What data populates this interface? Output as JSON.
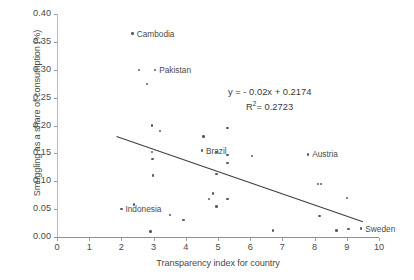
{
  "chart_data": {
    "type": "scatter",
    "title": "",
    "xlabel": "Transparency index for country",
    "ylabel": "Smuggling as a share of consumption (%)",
    "xlim": [
      0,
      10
    ],
    "ylim": [
      0,
      0.4
    ],
    "xticks": [
      "0",
      "1",
      "2",
      "3",
      "4",
      "5",
      "6",
      "7",
      "8",
      "9",
      "10"
    ],
    "yticks": [
      "0.00",
      "0.05",
      "0.10",
      "0.15",
      "0.20",
      "0.25",
      "0.30",
      "0.35",
      "0.40"
    ],
    "grid": false,
    "legend": "none",
    "trendline": {
      "equation": "y = - 0.02x + 0.2174",
      "r_squared_label": "R",
      "r_squared_exponent": "2",
      "r_squared_value": "= 0.2723",
      "slope": -0.02,
      "intercept": 0.2174,
      "x_start": 1.85,
      "x_end": 9.5
    },
    "points": [
      {
        "x": 2.35,
        "y": 0.365,
        "label": "Cambodia",
        "label_pos": "right"
      },
      {
        "x": 2.55,
        "y": 0.3,
        "label": "",
        "label_pos": ""
      },
      {
        "x": 3.05,
        "y": 0.3,
        "label": "Pakistan",
        "label_pos": "right"
      },
      {
        "x": 2.8,
        "y": 0.275,
        "label": "",
        "label_pos": ""
      },
      {
        "x": 2.95,
        "y": 0.2,
        "label": "",
        "label_pos": ""
      },
      {
        "x": 3.2,
        "y": 0.19,
        "label": "",
        "label_pos": ""
      },
      {
        "x": 5.3,
        "y": 0.195,
        "label": "",
        "label_pos": ""
      },
      {
        "x": 4.55,
        "y": 0.18,
        "label": "",
        "label_pos": ""
      },
      {
        "x": 2.95,
        "y": 0.152,
        "label": "",
        "label_pos": ""
      },
      {
        "x": 4.5,
        "y": 0.155,
        "label": "Brazil",
        "label_pos": "right"
      },
      {
        "x": 4.95,
        "y": 0.152,
        "label": "",
        "label_pos": ""
      },
      {
        "x": 5.3,
        "y": 0.147,
        "label": "",
        "label_pos": ""
      },
      {
        "x": 2.97,
        "y": 0.14,
        "label": "",
        "label_pos": ""
      },
      {
        "x": 6.05,
        "y": 0.145,
        "label": "",
        "label_pos": ""
      },
      {
        "x": 7.8,
        "y": 0.148,
        "label": "Austria",
        "label_pos": "right"
      },
      {
        "x": 5.3,
        "y": 0.133,
        "label": "",
        "label_pos": ""
      },
      {
        "x": 2.98,
        "y": 0.11,
        "label": "",
        "label_pos": ""
      },
      {
        "x": 4.95,
        "y": 0.113,
        "label": "",
        "label_pos": ""
      },
      {
        "x": 8.1,
        "y": 0.095,
        "label": "",
        "label_pos": ""
      },
      {
        "x": 8.2,
        "y": 0.095,
        "label": "",
        "label_pos": ""
      },
      {
        "x": 4.85,
        "y": 0.078,
        "label": "",
        "label_pos": ""
      },
      {
        "x": 4.72,
        "y": 0.068,
        "label": "",
        "label_pos": ""
      },
      {
        "x": 5.3,
        "y": 0.068,
        "label": "",
        "label_pos": ""
      },
      {
        "x": 9.0,
        "y": 0.07,
        "label": "",
        "label_pos": ""
      },
      {
        "x": 4.95,
        "y": 0.055,
        "label": "",
        "label_pos": ""
      },
      {
        "x": 2.4,
        "y": 0.058,
        "label": "",
        "label_pos": ""
      },
      {
        "x": 2.0,
        "y": 0.05,
        "label": "Indonesia",
        "label_pos": "right"
      },
      {
        "x": 8.15,
        "y": 0.038,
        "label": "",
        "label_pos": ""
      },
      {
        "x": 3.5,
        "y": 0.04,
        "label": "",
        "label_pos": ""
      },
      {
        "x": 3.93,
        "y": 0.03,
        "label": "",
        "label_pos": ""
      },
      {
        "x": 2.9,
        "y": 0.01,
        "label": "",
        "label_pos": ""
      },
      {
        "x": 6.7,
        "y": 0.012,
        "label": "",
        "label_pos": ""
      },
      {
        "x": 8.68,
        "y": 0.012,
        "label": "",
        "label_pos": ""
      },
      {
        "x": 9.05,
        "y": 0.014,
        "label": "",
        "label_pos": ""
      },
      {
        "x": 9.45,
        "y": 0.015,
        "label": "Sweden",
        "label_pos": "right"
      }
    ]
  },
  "colors": {
    "point": "#5b5b5b",
    "trendline": "#3f3f3f",
    "axis": "#8e8e8e",
    "text": "#4a4a4a"
  }
}
